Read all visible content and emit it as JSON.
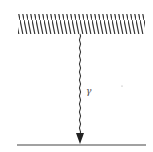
{
  "diagram": {
    "source": {
      "type": "hatched-slab"
    },
    "ray": {
      "label": "γ",
      "style": "wavy-arrow",
      "direction": "down"
    },
    "surface": {
      "type": "line"
    },
    "colors": {
      "ink": "#333333",
      "background": "#ffffff"
    }
  }
}
